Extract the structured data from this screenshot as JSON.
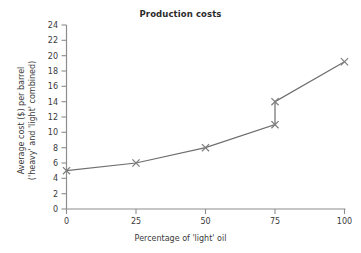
{
  "chart_data": {
    "type": "line",
    "title": "Production costs",
    "xlabel": "Percentage of 'light' oil",
    "ylabel_line1": "Average cost ($) per barrel",
    "ylabel_line2": "('heavy' and 'light' combined)",
    "x": [
      0,
      25,
      50,
      75,
      75,
      100
    ],
    "values": [
      5,
      6,
      8,
      11,
      14,
      19.2
    ],
    "series": [
      {
        "name": "Average cost ($) per barrel",
        "points": [
          {
            "x": 0,
            "y": 5
          },
          {
            "x": 25,
            "y": 6
          },
          {
            "x": 50,
            "y": 8
          },
          {
            "x": 75,
            "y": 11
          },
          {
            "x": 75,
            "y": 14
          },
          {
            "x": 100,
            "y": 19.2
          }
        ]
      }
    ],
    "xlim": [
      0,
      100
    ],
    "ylim": [
      0,
      24
    ],
    "xticks": [
      "0",
      "25",
      "50",
      "75",
      "100"
    ],
    "yticks": [
      "0",
      "2",
      "4",
      "6",
      "8",
      "10",
      "12",
      "14",
      "16",
      "18",
      "20",
      "22",
      "24"
    ],
    "grid": false,
    "legend": false,
    "marker": "x",
    "line_color": "#6e6e6e",
    "marker_color": "#7d7d7d",
    "axis_color": "#8c8c8c"
  }
}
